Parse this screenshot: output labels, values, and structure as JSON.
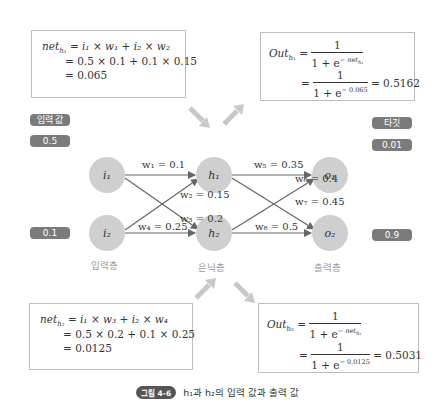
{
  "boxes": {
    "net_h1": {
      "line1_lhs": "net",
      "line1_sub": "h₁",
      "line1_rhs": "= i₁ × w₁ + i₂ × w₂",
      "line2": "= 0.5 × 0.1 + 0.1 × 0.15",
      "line3": "= 0.065"
    },
    "out_h1": {
      "lhs": "Out",
      "lhs_sub": "h₁",
      "eq1_num": "1",
      "eq1_den": "1 + e",
      "eq1_exp": "− net",
      "eq1_exp_sub": "h₁",
      "eq2_num": "1",
      "eq2_den": "1 + e",
      "eq2_exp": "− 0.065",
      "result": "= 0.5162"
    },
    "net_h2": {
      "line1_lhs": "net",
      "line1_sub": "h₂",
      "line1_rhs": "= i₁ × w₃ + i₂ × w₄",
      "line2": "= 0.5 × 0.2 + 0.1 × 0.25",
      "line3": "= 0.0125"
    },
    "out_h2": {
      "lhs": "Out",
      "lhs_sub": "h₂",
      "eq1_num": "1",
      "eq1_den": "1 + e",
      "eq1_exp": "− net",
      "eq1_exp_sub": "h₂",
      "eq2_num": "1",
      "eq2_den": "1 + e",
      "eq2_exp": "− 0.0125",
      "result": "= 0.5031"
    }
  },
  "labels": {
    "input_title": "입력 값",
    "input_values": [
      "0.5",
      "0.1"
    ],
    "target_title": "타깃",
    "target_values": [
      "0.01",
      "0.9"
    ]
  },
  "nodes": {
    "i1": "i₁",
    "i2": "i₂",
    "h1": "h₁",
    "h2": "h₂",
    "o1": "o₁",
    "o2": "o₂"
  },
  "weights": {
    "w1": "w₁ = 0.1",
    "w2": "w₂ = 0.15",
    "w3": "w₃ = 0.2",
    "w4": "w₄ = 0.25",
    "w5": "w₅ = 0.35",
    "w6": "w₆ = 0.4",
    "w7": "w₇ = 0.45",
    "w8": "w₈ = 0.5"
  },
  "layers": {
    "input": "입력층",
    "hidden": "은닉층",
    "output": "출력층"
  },
  "caption": {
    "badge": "그림 4-6",
    "text": "h₁과 h₂의 입력 값과 출력 값"
  },
  "colors": {
    "node_fill": "#cfcfcf",
    "edge": "#666666",
    "pill_bg": "#7b7b7b",
    "flow_arrow": "#c8c8c8"
  }
}
